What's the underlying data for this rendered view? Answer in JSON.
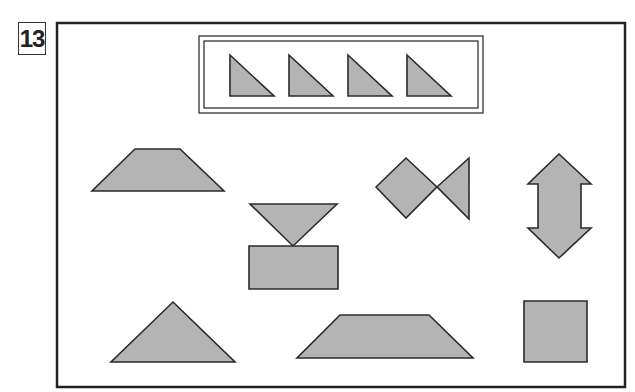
{
  "problem": {
    "number": "13"
  },
  "colors": {
    "shape_fill": "#b4b4b4",
    "stroke": "#2b2b2b",
    "background": "#ffffff"
  },
  "reference_box": {
    "description": "four identical right triangles",
    "shapes": [
      {
        "name": "right-triangle",
        "points": "230,55 230,96 274,96"
      },
      {
        "name": "right-triangle",
        "points": "289,55 289,96 333,96"
      },
      {
        "name": "right-triangle",
        "points": "348,55 348,96 392,96"
      },
      {
        "name": "right-triangle",
        "points": "407,55 407,96 451,96"
      }
    ]
  },
  "answer_shapes": [
    {
      "name": "trapezoid-wide",
      "type": "polygon",
      "points": "135,149 180,149 224,191 92,191"
    },
    {
      "name": "fish",
      "type": "polygon",
      "points": "376,187 406,158 437,187 469,158 469,219 437,187 406,218"
    },
    {
      "name": "double-arrow",
      "type": "polygon",
      "points": "559,154 591,184 581,184 581,228 591,228 559,258 528,228 538,228 538,184 528,184"
    },
    {
      "name": "inverted-triangle",
      "type": "polygon",
      "points": "250,204 337,204 293,246"
    },
    {
      "name": "rectangle",
      "type": "polygon",
      "points": "249,246 338,246 338,289 249,289"
    },
    {
      "name": "isosceles-triangle",
      "type": "polygon",
      "points": "173,302 235,362 111,362"
    },
    {
      "name": "trapezoid-long",
      "type": "polygon",
      "points": "340,315 429,315 473,358 297,358"
    },
    {
      "name": "square",
      "type": "polygon",
      "points": "524,301 587,301 587,362 524,362"
    }
  ]
}
